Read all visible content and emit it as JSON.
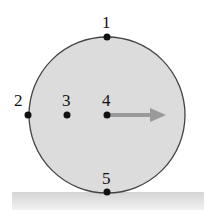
{
  "diagram": {
    "type": "rolling-wheel",
    "colors": {
      "wheel_fill": "#d9d9d9",
      "wheel_stroke": "#444444",
      "ground": "#cfcfcf",
      "arrow": "#9a9a9a",
      "point": "#111111"
    },
    "points": [
      {
        "label": "1",
        "position": "top"
      },
      {
        "label": "2",
        "position": "left edge"
      },
      {
        "label": "3",
        "position": "midway between edge and center"
      },
      {
        "label": "4",
        "position": "center"
      },
      {
        "label": "5",
        "position": "bottom (contact point)"
      }
    ],
    "arrow": {
      "from": "center",
      "direction": "right"
    }
  }
}
